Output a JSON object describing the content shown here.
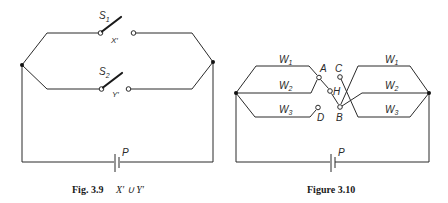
{
  "figure_left": {
    "caption_number": "Fig. 3.9",
    "caption_expression": "X′ ∪ Y′",
    "switch_top": {
      "label": "S",
      "sub": "1",
      "contact_label": "X′"
    },
    "switch_bottom": {
      "label": "S",
      "sub": "2",
      "contact_label": "Y′"
    },
    "battery_label": "P"
  },
  "figure_right": {
    "caption": "Figure 3.10",
    "left_wires": [
      {
        "label": "W",
        "sub": "1"
      },
      {
        "label": "W",
        "sub": "2"
      },
      {
        "label": "W",
        "sub": "3"
      }
    ],
    "right_wires": [
      {
        "label": "W",
        "sub": "1"
      },
      {
        "label": "W",
        "sub": "2"
      },
      {
        "label": "W",
        "sub": "3"
      }
    ],
    "contacts": {
      "a": "A",
      "b": "B",
      "c": "C",
      "d": "D",
      "h": "H"
    },
    "battery_label": "P"
  }
}
